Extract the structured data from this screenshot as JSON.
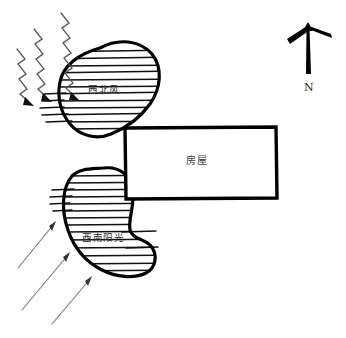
{
  "diagram": {
    "background_color": "#ffffff",
    "ink_color": "#000000",
    "shapes": {
      "house": {
        "label": "房屋",
        "kind": "rectangle",
        "x": 124,
        "y": 127,
        "width": 153,
        "height": 72,
        "stroke_color": "#000000",
        "fill_color": "#ffffff",
        "stroke_width": 3
      },
      "wind_blob": {
        "label": "西北风",
        "kind": "hatched-blob",
        "x": 55,
        "y": 40,
        "width": 108,
        "height": 96,
        "hatch": "horizontal",
        "stroke_color": "#000000"
      },
      "sun_blob": {
        "label": "西南阳光",
        "kind": "hatched-blob",
        "x": 60,
        "y": 165,
        "width": 96,
        "height": 112,
        "hatch": "horizontal",
        "stroke_color": "#000000"
      }
    },
    "compass": {
      "label": "N",
      "kind": "north-arrow",
      "x": 290,
      "y": 18,
      "direction": "up",
      "stroke_color": "#000000"
    },
    "wind_arrows": {
      "name": "zigzag-wind-rays",
      "count": 3,
      "style": "zigzag",
      "direction": "down-right",
      "color": "#4a4a4a"
    },
    "sun_arrows": {
      "name": "straight-sun-rays",
      "count": 3,
      "style": "straight",
      "direction": "up-right",
      "color": "#6b6b6b"
    }
  }
}
